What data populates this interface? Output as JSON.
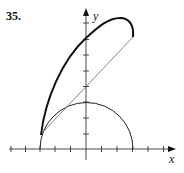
{
  "problem_number": "35.",
  "axes": {
    "x_label": "x",
    "y_label": "y",
    "origin_px": [
      86,
      149
    ],
    "unit_px": 15.5,
    "x_ticks": [
      -5,
      -4,
      -3,
      -2,
      -1,
      1,
      2,
      3,
      4,
      5
    ],
    "y_ticks": [
      1,
      2,
      3,
      4,
      5,
      6,
      7,
      8
    ]
  },
  "curves": [
    {
      "name": "semicircle",
      "description": "upper semicircle radius 3 centered at origin",
      "stroke": "#222222"
    },
    {
      "name": "thick-curve",
      "description": "bold curve from (-3,1) rising through (0,7.3) peaking near (2,8.5) ending at (3,7.2)",
      "stroke": "#111111"
    },
    {
      "name": "thin-line",
      "description": "line from about (-2.8,1.1) through (0,4) to (3,7.2)",
      "stroke": "#666666"
    }
  ]
}
